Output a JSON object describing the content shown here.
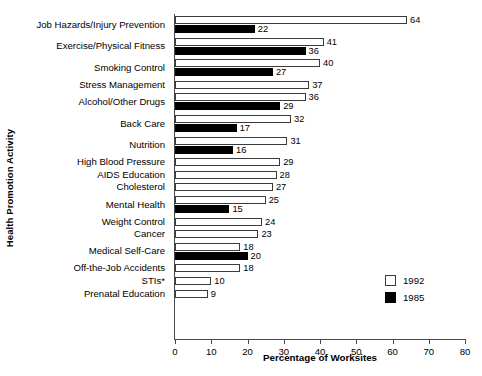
{
  "chart_data": {
    "type": "bar",
    "orientation": "horizontal",
    "title": "",
    "xlabel": "Percentage of Worksites",
    "ylabel": "Health Promotion Activity",
    "xlim": [
      0,
      80
    ],
    "xticks": [
      0,
      10,
      20,
      30,
      40,
      50,
      60,
      70,
      80
    ],
    "grid": false,
    "legend_position": "inside-bottom-right",
    "categories": [
      "Job Hazards/Injury Prevention",
      "Exercise/Physical Fitness",
      "Smoking Control",
      "Stress Management",
      "Alcohol/Other Drugs",
      "Back Care",
      "Nutrition",
      "High Blood Pressure",
      "AIDS Education",
      "Cholesterol",
      "Mental Health",
      "Weight Control",
      "Cancer",
      "Medical Self-Care",
      "Off-the-Job Accidents",
      "STIs*",
      "Prenatal Education"
    ],
    "series": [
      {
        "name": "1992",
        "color": "#ffffff",
        "values": [
          64,
          41,
          40,
          37,
          36,
          32,
          31,
          29,
          28,
          27,
          25,
          24,
          23,
          18,
          18,
          10,
          9
        ]
      },
      {
        "name": "1985",
        "color": "#000000",
        "values": [
          22,
          36,
          27,
          null,
          29,
          17,
          16,
          null,
          null,
          null,
          15,
          null,
          null,
          20,
          null,
          null,
          null
        ]
      }
    ]
  },
  "legend": {
    "items": [
      {
        "label": "1992",
        "swatch": "white-square"
      },
      {
        "label": "1985",
        "swatch": "black-square"
      }
    ]
  }
}
